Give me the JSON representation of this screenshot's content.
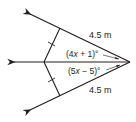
{
  "diagram": {
    "type": "geometry-angle-bisector",
    "colors": {
      "stroke": "#231f20",
      "background": "#ffffff"
    },
    "labels": {
      "upper_length": "4.5 m",
      "lower_length": "4.5 m",
      "upper_angle_pre": "(4",
      "upper_angle_var": "x",
      "upper_angle_post": " + 1)°",
      "lower_angle_pre": "(5",
      "lower_angle_var": "x",
      "lower_angle_post": " − 5)°"
    },
    "elements": {
      "vertex": [
        130,
        62
      ],
      "rays": [
        "upper-ray",
        "middle-ray",
        "lower-ray"
      ],
      "segments": [
        "upper-segment",
        "lower-segment"
      ],
      "congruence_ticks": 2
    }
  }
}
